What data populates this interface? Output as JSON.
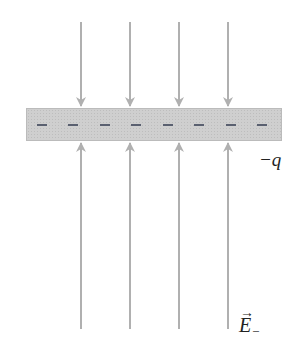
{
  "diagram": {
    "plate": {
      "charge_label": "−q",
      "charge_sign": "−",
      "charge_count": 8,
      "color": "#cfcfcf"
    },
    "field": {
      "label": "E",
      "label_vector": "→",
      "label_subscript": "−",
      "arrow_color": "#b0b0b0",
      "arrow_x": [
        81,
        130,
        179,
        228
      ],
      "top_arrows_direction": "down toward plate",
      "bottom_arrows_direction": "up toward plate"
    }
  }
}
